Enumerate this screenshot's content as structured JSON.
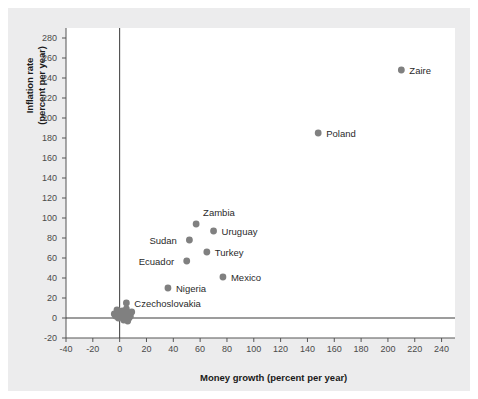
{
  "chart_data": {
    "type": "scatter",
    "title": "",
    "xlabel": "Money growth (percent per year)",
    "ylabel": "Inflation rate\n(percent per year)",
    "ylabel_line1": "Inflation rate",
    "ylabel_line2": "(percent per year)",
    "xlim": [
      -40,
      250
    ],
    "ylim": [
      -20,
      290
    ],
    "xticks": [
      -40,
      -20,
      0,
      20,
      40,
      60,
      80,
      100,
      120,
      140,
      160,
      180,
      200,
      220,
      240
    ],
    "yticks": [
      -20,
      0,
      20,
      40,
      60,
      80,
      100,
      120,
      140,
      160,
      180,
      200,
      220,
      240,
      260,
      280
    ],
    "grid": false,
    "legend": false,
    "zero_lines": true,
    "marker_color": "#808080",
    "axis_color": "#555555",
    "points": [
      {
        "name": "Zaire",
        "x": 210,
        "y": 248,
        "label_dx": 8,
        "label_dy": -4,
        "labeled": true
      },
      {
        "name": "Poland",
        "x": 148,
        "y": 185,
        "label_dx": 8,
        "label_dy": -4,
        "labeled": true
      },
      {
        "name": "Zambia",
        "x": 57,
        "y": 94,
        "label_dx": 7,
        "label_dy": -16,
        "labeled": true
      },
      {
        "name": "Uruguay",
        "x": 70,
        "y": 87,
        "label_dx": 8,
        "label_dy": -4,
        "labeled": true
      },
      {
        "name": "Sudan",
        "x": 52,
        "y": 78,
        "label_dx": -40,
        "label_dy": -4,
        "labeled": true
      },
      {
        "name": "Turkey",
        "x": 65,
        "y": 66,
        "label_dx": 8,
        "label_dy": -4,
        "labeled": true
      },
      {
        "name": "Ecuador",
        "x": 50,
        "y": 57,
        "label_dx": -48,
        "label_dy": -4,
        "labeled": true
      },
      {
        "name": "Mexico",
        "x": 77,
        "y": 41,
        "label_dx": 8,
        "label_dy": -4,
        "labeled": true
      },
      {
        "name": "Nigeria",
        "x": 36,
        "y": 30,
        "label_dx": 8,
        "label_dy": -4,
        "labeled": true
      },
      {
        "name": "Czechoslovakia",
        "x": 5,
        "y": 15,
        "label_dx": 8,
        "label_dy": -4,
        "labeled": true
      },
      {
        "name": "cluster-1",
        "x": 1,
        "y": 4,
        "labeled": false
      },
      {
        "name": "cluster-2",
        "x": 4,
        "y": 3,
        "labeled": false
      },
      {
        "name": "cluster-3",
        "x": -3,
        "y": 2,
        "labeled": false
      },
      {
        "name": "cluster-4",
        "x": 6,
        "y": 5,
        "labeled": false
      },
      {
        "name": "cluster-5",
        "x": 2,
        "y": 7,
        "labeled": false
      },
      {
        "name": "cluster-6",
        "x": 8,
        "y": 2,
        "labeled": false
      },
      {
        "name": "cluster-7",
        "x": -1,
        "y": 0,
        "labeled": false
      },
      {
        "name": "cluster-8",
        "x": 3,
        "y": -2,
        "labeled": false
      },
      {
        "name": "cluster-9",
        "x": 5,
        "y": 9,
        "labeled": false
      },
      {
        "name": "cluster-10",
        "x": 0,
        "y": 6,
        "labeled": false
      },
      {
        "name": "cluster-11",
        "x": 7,
        "y": 0,
        "labeled": false
      },
      {
        "name": "cluster-12",
        "x": -4,
        "y": 4,
        "labeled": false
      },
      {
        "name": "cluster-13",
        "x": 2,
        "y": 1,
        "labeled": false
      },
      {
        "name": "cluster-14",
        "x": 6,
        "y": -3,
        "labeled": false
      },
      {
        "name": "cluster-15",
        "x": 9,
        "y": 6,
        "labeled": false
      },
      {
        "name": "cluster-16",
        "x": -2,
        "y": 8,
        "labeled": false
      }
    ]
  }
}
